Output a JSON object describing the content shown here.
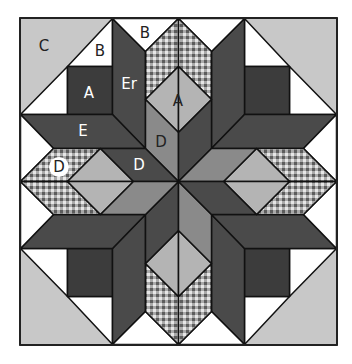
{
  "colors": {
    "background": "#c8c8c8",
    "white": "#ffffff",
    "dark": "#4a4a4a",
    "darker": "#3c3c3c",
    "medium": "#8a8a8a",
    "light": "#b4b4b4",
    "outline": "#111111",
    "check_light": "#e6e6e6",
    "check_dark": "#6a6a6a"
  },
  "labels": [
    {
      "id": "C",
      "text": "C",
      "x": 44,
      "y": 46,
      "color": "#222222"
    },
    {
      "id": "B-corner",
      "text": "B",
      "x": 100,
      "y": 51,
      "color": "#222222"
    },
    {
      "id": "B-top",
      "text": "B",
      "x": 145,
      "y": 33,
      "color": "#222222"
    },
    {
      "id": "A-square",
      "text": "A",
      "x": 89,
      "y": 93,
      "color": "#ffffff"
    },
    {
      "id": "Er",
      "text": "Er",
      "x": 129,
      "y": 84,
      "color": "#ffffff"
    },
    {
      "id": "A-diamond",
      "text": "A",
      "x": 178,
      "y": 101,
      "color": "#222222"
    },
    {
      "id": "E",
      "text": "E",
      "x": 83,
      "y": 131,
      "color": "#ffffff"
    },
    {
      "id": "D-inner",
      "text": "D",
      "x": 161,
      "y": 142,
      "color": "#222222"
    },
    {
      "id": "D-checked",
      "text": "D",
      "x": 59,
      "y": 167,
      "color": "#222222",
      "circle": true
    },
    {
      "id": "D-dark",
      "text": "D",
      "x": 139,
      "y": 165,
      "color": "#ffffff"
    }
  ]
}
